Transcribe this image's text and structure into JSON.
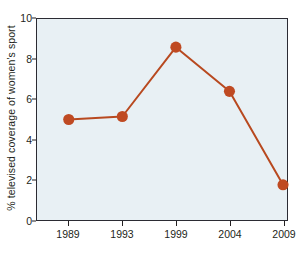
{
  "chart_data": {
    "type": "line",
    "title": "",
    "xlabel": "",
    "ylabel": "% televised coverage of women's sport",
    "categories": [
      "1989",
      "1993",
      "1999",
      "2004",
      "2009"
    ],
    "values": [
      5.0,
      5.15,
      8.6,
      6.4,
      1.75
    ],
    "series": [
      {
        "name": "% televised coverage of women's sport",
        "values": [
          5.0,
          5.15,
          8.6,
          6.4,
          1.75
        ]
      }
    ],
    "ylim": [
      0,
      10
    ],
    "y_ticks": [
      "0",
      "2",
      "4",
      "6",
      "8",
      "10"
    ],
    "y_tick_values": [
      0,
      2,
      4,
      6,
      8,
      10
    ],
    "x_ticks": [
      "1989",
      "1993",
      "1999",
      "2004",
      "2009"
    ],
    "grid": false,
    "legend": "none",
    "marker": "circle",
    "colors": {
      "line": "#b8491f",
      "marker": "#bf4a22",
      "plot_background": "#e8f0f4",
      "axis": "#2b2b33",
      "text": "#231f20",
      "figure_background": "#ffffff"
    }
  }
}
